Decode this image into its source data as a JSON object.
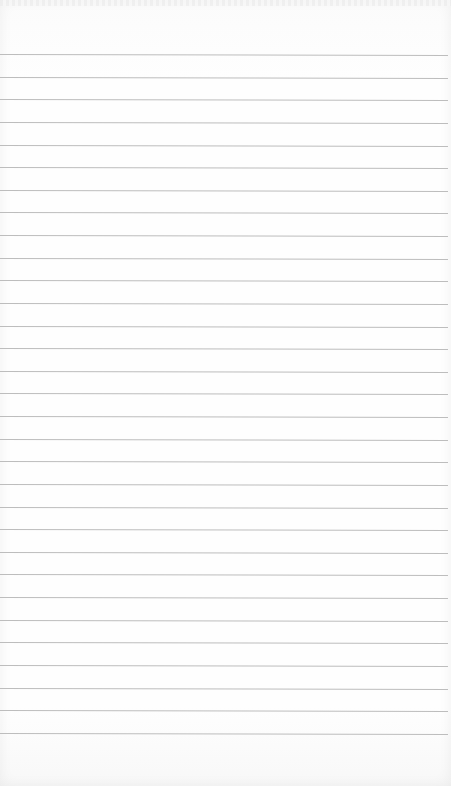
{
  "page": {
    "type": "lined-paper",
    "background_color": "#fefefe",
    "rule_color": "#bdbdbd",
    "rule_count": 31,
    "first_rule_y": 54,
    "rule_spacing": 22.63
  }
}
